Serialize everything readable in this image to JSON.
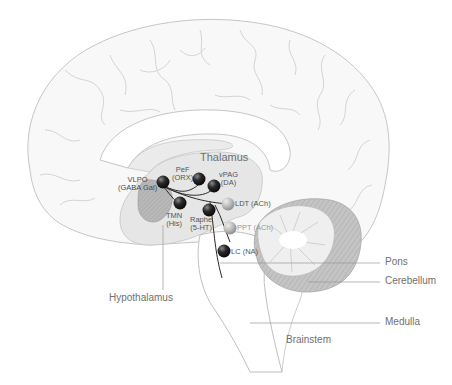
{
  "colors": {
    "background": "#ffffff",
    "cortex_fill": "#f7f7f7",
    "cortex_stroke": "#c8c8c8",
    "inner_fill": "#ececec",
    "thalamus_fill": "#e4e4e4",
    "hypothalamus_fill": "#b8b8b8",
    "cerebellum_outer": "#bdbdbd",
    "cerebellum_inner": "#ededed",
    "dark_node": "#1e1e1e",
    "light_node": "#b5b5b5",
    "pathway": "#2a2a2a",
    "leader_line": "#9a9a9a",
    "label_text": "#707070"
  },
  "regions": {
    "thalamus": "Thalamus",
    "hypothalamus": "Hypothalamus",
    "pons": "Pons",
    "cerebellum": "Cerebellum",
    "medulla": "Medulla",
    "brainstem": "Brainstem"
  },
  "nodes": [
    {
      "id": "vlpo",
      "line1": "VLPO",
      "line2": "(GABA Gal)",
      "shade": "dark"
    },
    {
      "id": "pef",
      "line1": "PeF",
      "line2": "(ORX)",
      "shade": "dark"
    },
    {
      "id": "vpag",
      "line1": "vPAG",
      "line2": "(DA)",
      "shade": "dark"
    },
    {
      "id": "tmn",
      "line1": "TMN",
      "line2": "(His)",
      "shade": "dark"
    },
    {
      "id": "raphe",
      "line1": "Raphe",
      "line2": "(5-HT)",
      "shade": "dark"
    },
    {
      "id": "ldt",
      "line1": "LDT (ACh)",
      "line2": "",
      "shade": "light"
    },
    {
      "id": "ppt",
      "line1": "PPT (ACh)",
      "line2": "",
      "shade": "light"
    },
    {
      "id": "lc",
      "line1": "LC (NA)",
      "line2": "",
      "shade": "dark"
    }
  ]
}
